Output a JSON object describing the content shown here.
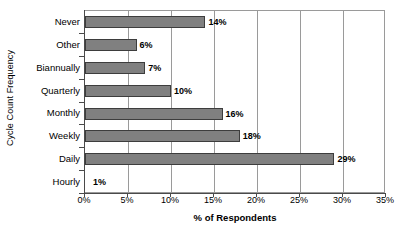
{
  "chart_data": {
    "type": "bar",
    "orientation": "horizontal",
    "title": "",
    "xlabel": "% of Respondents",
    "ylabel": "Cycle Count Frequency",
    "categories": [
      "Hourly",
      "Daily",
      "Weekly",
      "Monthly",
      "Quarterly",
      "Biannually",
      "Other",
      "Never"
    ],
    "values": [
      1,
      29,
      18,
      16,
      10,
      7,
      6,
      14
    ],
    "data_labels": [
      "1%",
      "29%",
      "18%",
      "16%",
      "10%",
      "7%",
      "6%",
      "14%"
    ],
    "category_order_top_to_bottom": [
      "Never",
      "Other",
      "Biannually",
      "Quarterly",
      "Monthly",
      "Weekly",
      "Daily",
      "Hourly"
    ],
    "values_top_to_bottom": [
      14,
      6,
      7,
      10,
      16,
      18,
      29,
      1
    ],
    "xlim": [
      0,
      35
    ],
    "xticks": [
      0,
      5,
      10,
      15,
      20,
      25,
      30,
      35
    ],
    "xtick_labels": [
      "0%",
      "5%",
      "10%",
      "15%",
      "20%",
      "25%",
      "30%",
      "35%"
    ],
    "grid": "vertical",
    "legend": "none",
    "bar_color": "#808080",
    "bar_border_color": "#3d3d3d",
    "axis_color": "#4a4a4a",
    "grid_color": "#9a9a9a",
    "background": "#ffffff"
  }
}
